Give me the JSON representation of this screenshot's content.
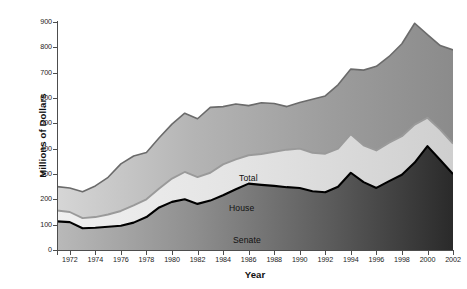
{
  "chart_data": {
    "type": "area",
    "title": "",
    "xlabel": "Year",
    "ylabel": "Millions of Dollars",
    "stacked": true,
    "grid": false,
    "legend_position": "inline-annotations",
    "xlim": [
      1971,
      2002
    ],
    "ylim": [
      0,
      900
    ],
    "ytick_step": 100,
    "yticks": [
      0,
      100,
      200,
      300,
      400,
      500,
      600,
      700,
      800,
      900
    ],
    "ytick_labels": [
      "0",
      "100",
      "200",
      "300",
      "400",
      "500",
      "600",
      "700",
      "800",
      "900"
    ],
    "xticks": [
      1971,
      1972,
      1974,
      1976,
      1978,
      1980,
      1982,
      1984,
      1986,
      1988,
      1990,
      1992,
      1994,
      1996,
      1998,
      2000,
      2002
    ],
    "xtick_labels": [
      "",
      "1972",
      "1974",
      "1976",
      "1978",
      "1980",
      "1982",
      "1984",
      "1986",
      "1988",
      "1990",
      "1992",
      "1994",
      "1996",
      "1998",
      "2000",
      "2002"
    ],
    "x": [
      1971,
      1972,
      1973,
      1974,
      1975,
      1976,
      1977,
      1978,
      1979,
      1980,
      1981,
      1982,
      1983,
      1984,
      1985,
      1986,
      1987,
      1988,
      1989,
      1990,
      1991,
      1992,
      1993,
      1994,
      1995,
      1996,
      1997,
      1998,
      1999,
      2000,
      2001,
      2002
    ],
    "series": [
      {
        "name": "Senate",
        "label": "Senate",
        "color": "#3d3d3d",
        "line_color": "#000000",
        "values": [
          113,
          110,
          86,
          88,
          92,
          96,
          108,
          130,
          168,
          190,
          200,
          182,
          195,
          216,
          240,
          262,
          257,
          253,
          248,
          245,
          232,
          228,
          250,
          305,
          268,
          245,
          272,
          297,
          345,
          410,
          355,
          300
        ]
      },
      {
        "name": "House",
        "label": "House",
        "color": "#e3e3e3",
        "line_color": "#9a9a9a",
        "values": [
          43,
          40,
          40,
          42,
          48,
          58,
          68,
          70,
          75,
          92,
          108,
          106,
          110,
          122,
          118,
          112,
          122,
          135,
          148,
          155,
          152,
          152,
          150,
          152,
          145,
          148,
          152,
          152,
          150,
          112,
          120,
          120
        ]
      },
      {
        "name": "Total",
        "label": "Total",
        "color": "#9e9e9e",
        "line_color": "#6b6b6b",
        "values": [
          94,
          95,
          104,
          123,
          147,
          186,
          195,
          185,
          200,
          215,
          232,
          230,
          258,
          228,
          218,
          196,
          202,
          190,
          170,
          182,
          211,
          228,
          252,
          257,
          297,
          332,
          340,
          365,
          400,
          328,
          332,
          370
        ]
      }
    ],
    "cumulative_total": [
      250,
      245,
      230,
      253,
      287,
      340,
      371,
      385,
      443,
      497,
      540,
      518,
      563,
      566,
      576,
      570,
      581,
      578,
      566,
      582,
      595,
      608,
      652,
      714,
      710,
      725,
      764,
      814,
      895,
      850,
      807,
      790
    ],
    "annotations": [
      {
        "text": "Total",
        "at_year": 1983
      },
      {
        "text": "House",
        "at_year": 1982
      },
      {
        "text": "Senate",
        "at_year": 1982
      }
    ]
  }
}
